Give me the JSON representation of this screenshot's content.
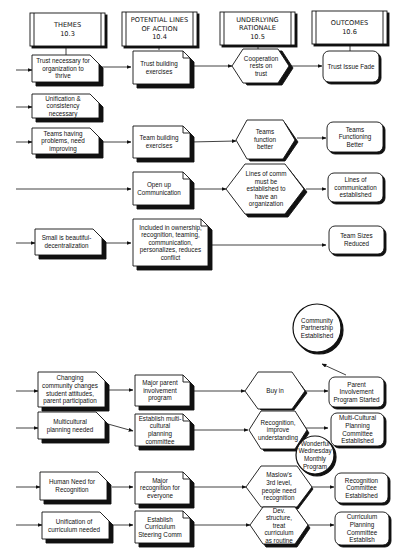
{
  "headers": [
    {
      "title": "THEMES",
      "code": "10.3"
    },
    {
      "title": "POTENTIAL LINES OF ACTION",
      "code": "10.4"
    },
    {
      "title": "UNDERLYING RATIONALE",
      "code": "10.5"
    },
    {
      "title": "OUTCOMES",
      "code": "10.6"
    }
  ],
  "top_section": {
    "rows": [
      {
        "theme": "Trust necessary for organization to thrive",
        "action": "Trust building exercises",
        "rationale": "Cooperation rests on trust",
        "outcome": "Trust Issue Fade"
      },
      {
        "theme": "Unification & consistency necessary",
        "action": "",
        "rationale": "",
        "outcome": ""
      },
      {
        "theme": "Teams having problems, need improving",
        "action": "Team  building exercises",
        "rationale": "Teams function better",
        "outcome": "Teams Functioning Better"
      },
      {
        "theme": "",
        "action": "Open up Communication",
        "rationale": "Lines of comm must be established to have an organization",
        "outcome": "Lines of communication established"
      },
      {
        "theme": "Small is beautiful-decentralization",
        "action": "Included in ownership, recognition, teaming, communication, personalizes, reduces conflict",
        "rationale": "",
        "outcome": "Team Sizes Reduced"
      }
    ]
  },
  "bottom_section": {
    "rows": [
      {
        "theme": "Changing community changes student attitudes, parent participation",
        "action": "Major parent involvement program",
        "rationale": "Buy in",
        "outcome": "Parent Involvement Program Started"
      },
      {
        "theme": "Multicultural planning needed",
        "action": "Establish multi-cultural planning committee",
        "rationale": "Recognition, improve understanding",
        "outcome": "Multi-Cultural Planning Committee Established"
      },
      {
        "theme": "Human Need for Recognition",
        "action": "Major recognition for everyone",
        "rationale": "Maslow's 3rd level, people need recognition",
        "outcome": "Recognition Committee Established"
      },
      {
        "theme": "Unification of curriculum needed",
        "action": "Establish Curriculum Steering Comm",
        "rationale": "Dev. structure, treat curriculum as routine",
        "outcome": "Curriculum Planning Committee Establish"
      }
    ],
    "circles": [
      {
        "label": "Community Partnership Established"
      },
      {
        "label": "Wonderful Wednesday Monthly Program"
      }
    ]
  },
  "colors": {
    "line": "#111111",
    "fill": "#ffffff",
    "shadow": "#111111"
  }
}
